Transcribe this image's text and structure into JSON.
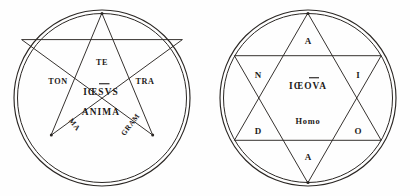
{
  "plate": {
    "title": "Pentagram and Hexagram Plate",
    "background_color": "#fefefe",
    "ink_color": "#2b2724",
    "text_color": "#1d1a18"
  },
  "figures": [
    {
      "id": "pentagram",
      "name": "Pentagram in double circle",
      "shape": "pentagram",
      "center_lines": [
        {
          "id": "iesvs",
          "text": "IŒSVS",
          "display": "IŒSVS",
          "has_macron": true
        },
        {
          "id": "anima",
          "text": "ANIMA",
          "has_macron": false
        }
      ],
      "point_labels": [
        {
          "id": "te",
          "text": "TE",
          "rotation": 0
        },
        {
          "id": "tra",
          "text": "TRA",
          "rotation": 0
        },
        {
          "id": "gram",
          "text": "GRAM",
          "rotation": -52
        },
        {
          "id": "ma",
          "text": "MA",
          "rotation": 52
        },
        {
          "id": "ton",
          "text": "TON",
          "rotation": 0
        }
      ],
      "word_spelled": "TETRAGRAMMATON"
    },
    {
      "id": "hexagram",
      "name": "Hexagram in double circle",
      "shape": "hexagram",
      "center_lines": [
        {
          "id": "ieova",
          "text": "IŒOVA",
          "display": "IŒOVA",
          "has_macron": true
        },
        {
          "id": "homo",
          "text": "Homo",
          "has_macron": false
        }
      ],
      "point_labels": [
        {
          "id": "a-top",
          "text": "A"
        },
        {
          "id": "i-right",
          "text": "I"
        },
        {
          "id": "o-bottom-right",
          "text": "O"
        },
        {
          "id": "a-bottom",
          "text": "A"
        },
        {
          "id": "d-bottom-left",
          "text": "D"
        },
        {
          "id": "n-left",
          "text": "N"
        }
      ],
      "word_spelled": "ADONAI"
    }
  ]
}
